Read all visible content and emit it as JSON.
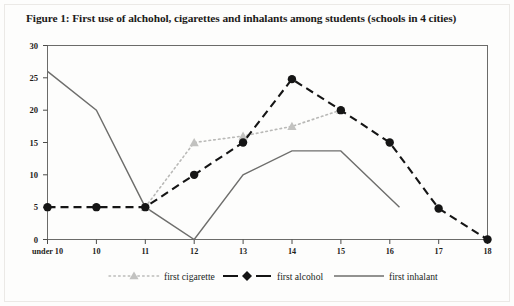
{
  "figure": {
    "title": "Figure 1: First use of alchohol, cigarettes and inhalants among students (schools in 4 cities)"
  },
  "chart_data": {
    "type": "line",
    "title": "Figure 1: First use of alchohol, cigarettes and inhalants among students (schools in 4 cities)",
    "xlabel": "",
    "ylabel": "",
    "categories": [
      "under 10",
      "10",
      "11",
      "12",
      "13",
      "14",
      "15",
      "16",
      "17",
      "18"
    ],
    "ylim": [
      0,
      30
    ],
    "yticks": [
      0,
      5,
      10,
      15,
      20,
      25,
      30
    ],
    "grid": false,
    "legend_position": "bottom",
    "series": [
      {
        "name": "first cigarette",
        "color": "#b9b9b7",
        "line_style": "dotted",
        "marker": "triangle",
        "x": [
          "11",
          "12",
          "13",
          "14",
          "15"
        ],
        "values": [
          5,
          15,
          16,
          17.5,
          20
        ]
      },
      {
        "name": "first alcohol",
        "color": "#151515",
        "line_style": "dashed",
        "marker": "diamond",
        "x": [
          "under 10",
          "10",
          "11",
          "12",
          "13",
          "14",
          "15",
          "16",
          "17",
          "18"
        ],
        "values": [
          5,
          5,
          5,
          10,
          15,
          24.8,
          20,
          15,
          4.8,
          0
        ]
      },
      {
        "name": "first inhalant",
        "color": "#6e6e6c",
        "line_style": "solid",
        "marker": "none",
        "x": [
          "under 10",
          "10",
          "11",
          "12",
          "13",
          "14",
          "15",
          "16.2"
        ],
        "values": [
          26,
          20,
          5,
          0,
          10,
          13.7,
          13.7,
          5
        ]
      }
    ]
  },
  "axes": {
    "y_tick_labels": [
      "30",
      "25",
      "20",
      "15",
      "10",
      "5",
      "0"
    ],
    "x_tick_labels": [
      "under 10",
      "10",
      "11",
      "12",
      "13",
      "14",
      "15",
      "16",
      "17",
      "18"
    ]
  },
  "legend": {
    "items": [
      {
        "label": "first cigarette"
      },
      {
        "label": "first alcohol"
      },
      {
        "label": "first inhalant"
      }
    ]
  }
}
